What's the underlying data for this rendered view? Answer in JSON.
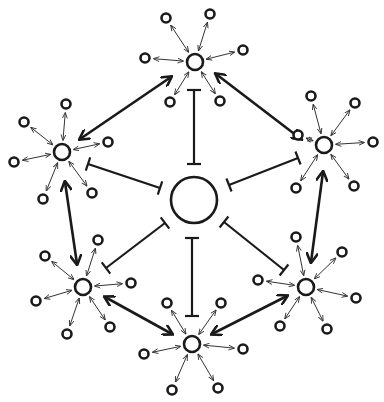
{
  "diagram": {
    "type": "network",
    "colors": {
      "stroke": "#1a1a1a",
      "background": "#ffffff"
    },
    "center": {
      "id": "center",
      "x": 194,
      "y": 200,
      "r": 23
    },
    "hubs": [
      {
        "id": "hub-top",
        "x": 195,
        "y": 62,
        "r": 8,
        "satellites": [
          [
            166,
            18
          ],
          [
            210,
            14
          ],
          [
            243,
            50
          ],
          [
            145,
            58
          ],
          [
            170,
            102
          ],
          [
            220,
            101
          ]
        ]
      },
      {
        "id": "hub-left",
        "x": 62,
        "y": 152,
        "r": 8,
        "satellites": [
          [
            66,
            104
          ],
          [
            24,
            122
          ],
          [
            108,
            142
          ],
          [
            14,
            162
          ],
          [
            43,
            199
          ],
          [
            92,
            193
          ]
        ]
      },
      {
        "id": "hub-right",
        "x": 324,
        "y": 145,
        "r": 8,
        "satellites": [
          [
            311,
            96
          ],
          [
            355,
            103
          ],
          [
            373,
            142
          ],
          [
            298,
            135
          ],
          [
            296,
            188
          ],
          [
            354,
            186
          ]
        ]
      },
      {
        "id": "hub-lower-left",
        "x": 83,
        "y": 287,
        "r": 8,
        "satellites": [
          [
            45,
            256
          ],
          [
            98,
            240
          ],
          [
            131,
            283
          ],
          [
            36,
            301
          ],
          [
            67,
            334
          ],
          [
            110,
            327
          ]
        ]
      },
      {
        "id": "hub-lower-right",
        "x": 306,
        "y": 287,
        "r": 8,
        "satellites": [
          [
            296,
            237
          ],
          [
            342,
            252
          ],
          [
            356,
            298
          ],
          [
            258,
            280
          ],
          [
            280,
            326
          ],
          [
            327,
            329
          ]
        ]
      },
      {
        "id": "hub-bottom",
        "x": 192,
        "y": 344,
        "r": 8,
        "satellites": [
          [
            167,
            303
          ],
          [
            221,
            303
          ],
          [
            243,
            349
          ],
          [
            144,
            354
          ],
          [
            172,
            390
          ],
          [
            218,
            388
          ]
        ]
      }
    ],
    "activation_edges": [
      {
        "from": "hub-left",
        "to": "hub-top",
        "x1": 80,
        "y1": 139,
        "x2": 171,
        "y2": 77
      },
      {
        "from": "hub-top",
        "to": "hub-right",
        "x1": 216,
        "y1": 74,
        "x2": 301,
        "y2": 139
      },
      {
        "from": "hub-left",
        "to": "hub-lower-left",
        "x1": 65,
        "y1": 182,
        "x2": 77,
        "y2": 264
      },
      {
        "from": "hub-right",
        "to": "hub-lower-right",
        "x1": 323,
        "y1": 172,
        "x2": 311,
        "y2": 262
      },
      {
        "from": "hub-lower-left",
        "to": "hub-bottom",
        "x1": 105,
        "y1": 297,
        "x2": 172,
        "y2": 334
      },
      {
        "from": "hub-bottom",
        "to": "hub-lower-right",
        "x1": 212,
        "y1": 334,
        "x2": 287,
        "y2": 296
      }
    ],
    "inhibition_edges": [
      {
        "from": "hub-top",
        "to": "center",
        "x1": 194,
        "y1": 90,
        "x2": 194,
        "y2": 164
      },
      {
        "from": "hub-left",
        "to": "center",
        "x1": 88,
        "y1": 164,
        "x2": 160,
        "y2": 188
      },
      {
        "from": "hub-right",
        "to": "center",
        "x1": 298,
        "y1": 158,
        "x2": 229,
        "y2": 185
      },
      {
        "from": "hub-lower-left",
        "to": "center",
        "x1": 106,
        "y1": 268,
        "x2": 165,
        "y2": 223
      },
      {
        "from": "hub-lower-right",
        "to": "center",
        "x1": 284,
        "y1": 270,
        "x2": 224,
        "y2": 222
      },
      {
        "from": "hub-bottom",
        "to": "center",
        "x1": 192,
        "y1": 316,
        "x2": 192,
        "y2": 238
      }
    ]
  }
}
